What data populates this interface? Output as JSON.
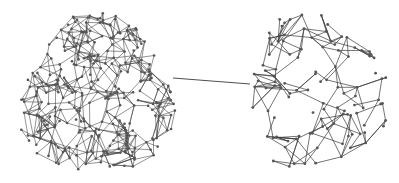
{
  "diagram": {
    "type": "network-graph",
    "width": 399,
    "height": 183,
    "background": "#ffffff",
    "edge_color": "#3a3a3a",
    "node_color": "#555555",
    "clusters": [
      {
        "name": "dense-cluster",
        "center": [
          97,
          95
        ],
        "radius_x": 78,
        "radius_y": 82,
        "node_count": 300,
        "edges_per_node": 4,
        "node_radius": 1.3,
        "edge_width": 0.55,
        "neighbor_dist": 24,
        "seed": 7
      },
      {
        "name": "sparse-cluster",
        "center": [
          316,
          92
        ],
        "radius_x": 70,
        "radius_y": 78,
        "node_count": 110,
        "edges_per_node": 3,
        "node_radius": 1.4,
        "edge_width": 0.7,
        "neighbor_dist": 32,
        "seed": 13
      }
    ],
    "bridge": {
      "from": [
        173,
        78
      ],
      "to": [
        250,
        84
      ],
      "width": 0.9
    }
  }
}
